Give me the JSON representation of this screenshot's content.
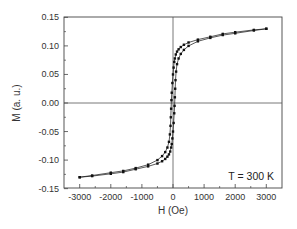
{
  "chart_data": {
    "type": "line",
    "title": "",
    "xlabel": "H (Oe)",
    "ylabel": "M (a. u.)",
    "xlim": [
      -3300,
      3500
    ],
    "ylim": [
      -0.15,
      0.15
    ],
    "xticks": [
      -3000,
      -2000,
      -1000,
      0,
      1000,
      2000,
      3000
    ],
    "xtick_labels": [
      "-3000",
      "-2000",
      "-1000",
      "0",
      "1000",
      "2000",
      "3000"
    ],
    "yticks": [
      0.15,
      0.1,
      0.05,
      0.0,
      -0.05,
      -0.1,
      -0.15
    ],
    "ytick_labels": [
      "0.15",
      "0.10",
      "0.05",
      "0.00",
      "-0.05",
      "-0.10",
      "-0.15"
    ],
    "grid": false,
    "legend": null,
    "reference_lines": {
      "x": 0,
      "y": 0
    },
    "annotations": [
      {
        "text": "T = 300 K",
        "position": "lower-right"
      }
    ],
    "series": [
      {
        "name": "descending branch",
        "marker": "square",
        "x": [
          3000,
          2600,
          2000,
          1600,
          1200,
          800,
          500,
          350,
          250,
          180,
          130,
          90,
          60,
          40,
          20,
          0,
          -20,
          -40,
          -50,
          -60,
          -70,
          -80,
          -100,
          -130,
          -180,
          -250,
          -350,
          -500,
          -800,
          -1200,
          -1600,
          -2000,
          -2600,
          -3000
        ],
        "y": [
          0.13,
          0.128,
          0.124,
          0.121,
          0.116,
          0.111,
          0.106,
          0.102,
          0.098,
          0.094,
          0.09,
          0.085,
          0.078,
          0.072,
          0.062,
          0.05,
          0.035,
          0.018,
          0.005,
          -0.01,
          -0.025,
          -0.04,
          -0.055,
          -0.068,
          -0.078,
          -0.086,
          -0.093,
          -0.1,
          -0.108,
          -0.114,
          -0.119,
          -0.122,
          -0.127,
          -0.13
        ]
      },
      {
        "name": "ascending branch",
        "marker": "square",
        "x": [
          -3000,
          -2600,
          -2000,
          -1600,
          -1200,
          -800,
          -500,
          -350,
          -250,
          -180,
          -130,
          -90,
          -60,
          -40,
          -20,
          0,
          20,
          40,
          50,
          60,
          70,
          80,
          100,
          130,
          180,
          250,
          350,
          500,
          800,
          1200,
          1600,
          2000,
          2600,
          3000
        ],
        "y": [
          -0.13,
          -0.128,
          -0.124,
          -0.121,
          -0.116,
          -0.111,
          -0.106,
          -0.102,
          -0.098,
          -0.094,
          -0.09,
          -0.085,
          -0.078,
          -0.072,
          -0.062,
          -0.05,
          -0.035,
          -0.018,
          -0.005,
          0.01,
          0.025,
          0.04,
          0.055,
          0.068,
          0.078,
          0.086,
          0.093,
          0.1,
          0.108,
          0.114,
          0.119,
          0.122,
          0.127,
          0.13
        ]
      }
    ]
  },
  "colors": {
    "axis": "#333333",
    "curve": "#111111",
    "background": "#ffffff"
  }
}
